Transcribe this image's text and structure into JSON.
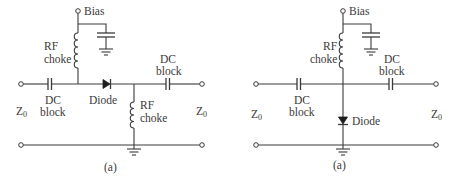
{
  "figure": {
    "type": "circuit-schematic",
    "colors": {
      "stroke": "#3a3a3a",
      "diode": "#1e1e1e",
      "background": "#ffffff"
    }
  },
  "circuits": [
    {
      "id": "series",
      "caption": "(a)",
      "labels": {
        "bias": "Bias",
        "rf_choke_top_line1": "RF",
        "rf_choke_top_line2": "choke",
        "dc_block_left_line1": "DC",
        "dc_block_left_line2": "block",
        "dc_block_right_line1": "DC",
        "dc_block_right_line2": "block",
        "diode": "Diode",
        "rf_choke_bottom_line1": "RF",
        "rf_choke_bottom_line2": "choke",
        "z0_left": "Z",
        "z0_left_sub": "0",
        "z0_right": "Z",
        "z0_right_sub": "0"
      }
    },
    {
      "id": "shunt",
      "caption": "(a)",
      "labels": {
        "bias": "Bias",
        "rf_choke_line1": "RF",
        "rf_choke_line2": "choke",
        "dc_block_left_line1": "DC",
        "dc_block_left_line2": "block",
        "dc_block_right_line1": "DC",
        "dc_block_right_line2": "block",
        "diode": "Diode",
        "z0_left": "Z",
        "z0_left_sub": "0",
        "z0_right": "Z",
        "z0_right_sub": "0"
      }
    }
  ]
}
